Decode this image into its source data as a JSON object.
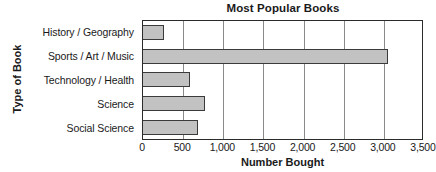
{
  "chart_data": {
    "type": "bar",
    "orientation": "horizontal",
    "title": "Most Popular Books",
    "xlabel": "Number Bought",
    "ylabel": "Type of Book",
    "categories": [
      "History / Geography",
      "Sports / Art / Music",
      "Technology / Health",
      "Science",
      "Social Science"
    ],
    "values": [
      260,
      3050,
      590,
      775,
      690
    ],
    "xlim": [
      0,
      3500
    ],
    "xticks": [
      0,
      500,
      1000,
      1500,
      2000,
      2500,
      3000,
      3500
    ],
    "xtick_labels": [
      "0",
      "500",
      "1,000",
      "1,500",
      "2,000",
      "2,500",
      "3,000",
      "3,500"
    ],
    "grid": true,
    "grid_axis": "x",
    "legend": false,
    "bar_color": "#c2c2c2",
    "bar_edge_color": "#3a3a3a",
    "axis_color": "#2b2b2b",
    "grid_color": "#8a8a8a",
    "background_color": "#ffffff"
  }
}
